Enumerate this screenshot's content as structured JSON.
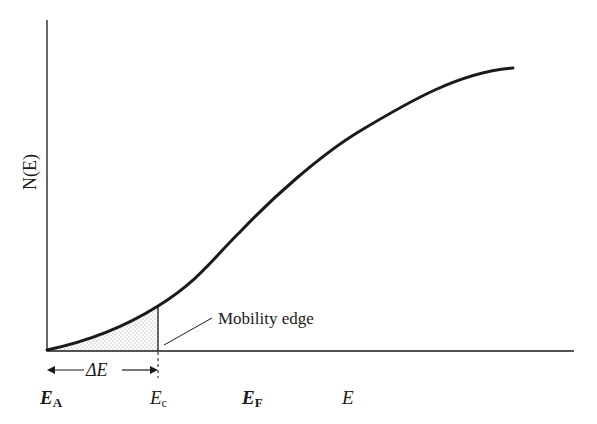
{
  "diagram": {
    "type": "density-of-states",
    "y_axis_label": "N(E)",
    "x_axis_label": "E",
    "annotation": "Mobility edge",
    "interval_label": "ΔE",
    "x_markers": [
      {
        "main": "E",
        "sub": "A",
        "x": 47
      },
      {
        "main": "E",
        "sub": "c",
        "x": 158
      },
      {
        "main": "E",
        "sub": "F",
        "x": 262
      },
      {
        "main": "E",
        "sub": "",
        "x": 348
      }
    ],
    "curve_points": [
      [
        47,
        350
      ],
      [
        100,
        333
      ],
      [
        158,
        306
      ],
      [
        200,
        268
      ],
      [
        240,
        232
      ],
      [
        300,
        175
      ],
      [
        360,
        131
      ],
      [
        420,
        97
      ],
      [
        470,
        78
      ],
      [
        513,
        68
      ]
    ],
    "colors": {
      "ink": "#1a1a1a",
      "background": "#ffffff",
      "shading": "#9a9a9a"
    }
  }
}
